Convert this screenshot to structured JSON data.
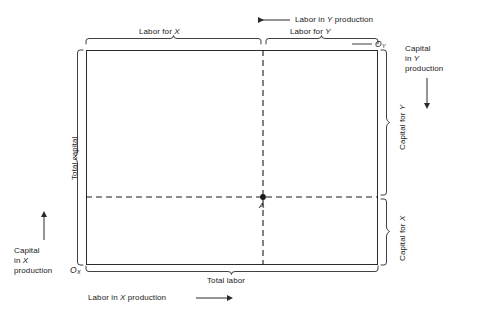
{
  "figure": {
    "type": "edgeworth-box",
    "box": {
      "left": 86,
      "top": 50,
      "right": 378,
      "bottom": 265
    },
    "allocation_point": {
      "label": "A",
      "x": 263,
      "y": 197,
      "labor_for_x_fraction": 0.606,
      "labor_for_y_fraction": 0.394,
      "capital_for_x_fraction": 0.316,
      "capital_for_y_fraction": 0.684
    }
  },
  "origins": {
    "x_origin": {
      "letter": "O",
      "subscript": "X"
    },
    "y_origin": {
      "letter": "O",
      "subscript": "Y"
    }
  },
  "top": {
    "direction_label": "Labor in ",
    "direction_var": "Y",
    "direction_tail": " production",
    "direction_arrow": "left-arrow-icon",
    "brace_left_label_prefix": "Labor for ",
    "brace_left_label_var": "X",
    "brace_right_label_prefix": "Labor for ",
    "brace_right_label_var": "Y"
  },
  "bottom": {
    "brace_label": "Total labor",
    "direction_label": "Labor in ",
    "direction_var": "X",
    "direction_tail": " production",
    "direction_arrow": "right-arrow-icon"
  },
  "left": {
    "brace_label": "Total capital",
    "direction_line1": "Capital",
    "direction_line2_prefix": "in ",
    "direction_line2_var": "X",
    "direction_line3": "production",
    "direction_arrow": "up-arrow-icon"
  },
  "right": {
    "brace_upper_prefix": "Capital for ",
    "brace_upper_var": "Y",
    "brace_lower_prefix": "Capital for ",
    "brace_lower_var": "X",
    "direction_line1": "Capital",
    "direction_line2_prefix": "in ",
    "direction_line2_var": "Y",
    "direction_line3": "production",
    "direction_arrow": "down-arrow-icon"
  },
  "colors": {
    "line": "#2b2b2b",
    "text": "#1a1a1a",
    "background": "#ffffff"
  }
}
